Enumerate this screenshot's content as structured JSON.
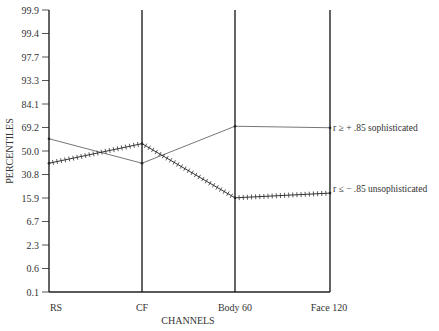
{
  "chart_data": {
    "type": "line",
    "title": "",
    "xlabel": "CHANNELS",
    "ylabel": "PERCENTILES",
    "categories": [
      "RS",
      "CF",
      "Body 60",
      "Face 120"
    ],
    "y_ticks": [
      "99.9",
      "99.4",
      "97.7",
      "93.3",
      "84.1",
      "69.2",
      "50.0",
      "30.8",
      "15.9",
      "6.7",
      "2.3",
      "0.6",
      "0.1"
    ],
    "y_scale": "normal-probability (percentile)",
    "ylim": [
      0.1,
      99.9
    ],
    "grid": false,
    "series": [
      {
        "name": "r ≥ + .85 sophisticated",
        "style": "thin solid line",
        "values": [
          60,
          40,
          70,
          69
        ]
      },
      {
        "name": "r ≤ − .85 unsophisticated",
        "style": "crossed (hatched) line",
        "values": [
          40,
          56,
          16,
          19
        ]
      }
    ],
    "legend_position": "inline right of last point"
  },
  "labels": {
    "ylabel": "PERCENTILES",
    "xlabel": "CHANNELS",
    "legend_soph": "r ≥ + .85 sophisticated",
    "legend_unsoph": "r ≤ − .85 unsophisticated"
  }
}
